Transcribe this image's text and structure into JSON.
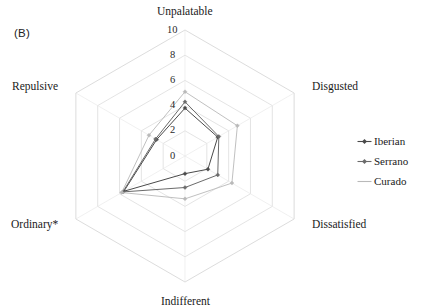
{
  "figure": {
    "panel_label": "(B)"
  },
  "legend": {
    "position": "right",
    "items": [
      {
        "label": "Iberian",
        "color": "#4a4a4a",
        "marker": "diamond-line-marker"
      },
      {
        "label": "Serrano",
        "color": "#6b6b6b",
        "marker": "diamond-line-marker"
      },
      {
        "label": "Curado",
        "color": "#b9b9b9",
        "marker": "line-marker"
      }
    ]
  },
  "chart_data": {
    "type": "radar",
    "title": "",
    "subtitle": "",
    "xlabel": "",
    "ylabel": "",
    "categories": [
      "Unpalatable",
      "Disgusted",
      "Dissatisfied",
      "Indifferent",
      "Ordinary*",
      "Repulsive"
    ],
    "tick_values": [
      0,
      2,
      4,
      6,
      8,
      10
    ],
    "tick_labels": [
      "0",
      "2",
      "4",
      "6",
      "8",
      "10"
    ],
    "rlim": [
      0,
      10
    ],
    "grid": true,
    "grid_shape": "hexagon",
    "grid_color": "#d8d8d8",
    "legend_position": "right",
    "annotations": [
      "(B)",
      "* denotes significant difference"
    ],
    "series": [
      {
        "name": "Iberian",
        "color": "#4a4a4a",
        "values": [
          3.8,
          3.0,
          2.1,
          1.4,
          5.6,
          2.6
        ]
      },
      {
        "name": "Serrano",
        "color": "#6b6b6b",
        "values": [
          4.3,
          3.1,
          3.0,
          2.5,
          5.7,
          2.7
        ]
      },
      {
        "name": "Curado",
        "color": "#b9b9b9",
        "values": [
          5.1,
          4.8,
          4.3,
          3.4,
          5.8,
          3.3
        ]
      }
    ]
  },
  "geometry": {
    "center_x": 185,
    "center_y": 156,
    "outer_radius": 126
  }
}
